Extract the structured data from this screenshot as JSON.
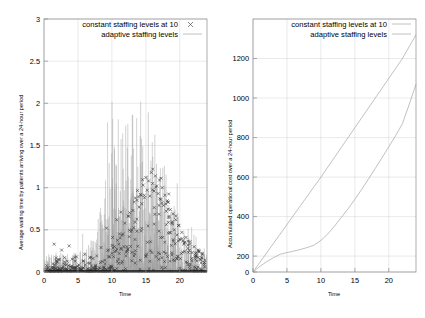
{
  "figure": {
    "panels": [
      "left",
      "right"
    ],
    "background": "#ffffff",
    "line_color": "#8d8d8d",
    "point_color": "#3a3a3a",
    "grid_color": "#c9c9c9"
  },
  "chart_data": [
    {
      "id": "waiting-time-chart",
      "type": "scatter",
      "title": "",
      "xlabel": "Time",
      "ylabel": "Average waiting time by patients arriving over a 24-hour period",
      "xlim": [
        0,
        24
      ],
      "ylim": [
        0,
        3
      ],
      "xticks": [
        0,
        5,
        10,
        15,
        20
      ],
      "yticks": [
        0,
        0.5,
        1,
        1.5,
        2,
        2.5,
        3
      ],
      "grid": true,
      "legend_position": "top-center",
      "series": [
        {
          "name": "constant staffing levels at 10",
          "style": "points",
          "marker": "cross",
          "x": [
            0.4,
            0.7,
            1.1,
            1.5,
            1.9,
            2.2,
            2.6,
            3.0,
            3.3,
            3.7,
            4.1,
            4.4,
            4.8,
            5.2,
            5.6,
            6.0,
            6.4,
            6.8,
            7.2,
            7.6,
            8.0,
            8.4,
            8.8,
            9.2,
            9.5,
            9.8,
            10.1,
            10.4,
            10.7,
            11.0,
            11.3,
            11.6,
            11.9,
            12.2,
            12.5,
            12.8,
            13.1,
            13.4,
            13.7,
            14.0,
            14.2,
            14.4,
            14.6,
            14.8,
            15.0,
            15.2,
            15.4,
            15.6,
            15.8,
            16.0,
            16.2,
            16.4,
            16.6,
            16.8,
            17.0,
            17.2,
            17.4,
            17.6,
            17.8,
            18.0,
            18.2,
            18.4,
            18.6,
            18.8,
            19.0,
            19.2,
            19.4,
            19.6,
            19.8,
            20.0,
            20.3,
            20.6,
            20.9,
            21.2,
            21.5,
            21.8,
            22.1,
            22.4,
            22.7,
            23.0,
            23.3,
            23.6
          ],
          "y": [
            0.03,
            0.02,
            0.05,
            0.33,
            0.12,
            0.02,
            0.26,
            0.09,
            0.04,
            0.31,
            0.07,
            0.02,
            0.18,
            0.05,
            0.03,
            0.21,
            0.04,
            0.02,
            0.16,
            0.08,
            0.03,
            0.29,
            0.06,
            0.52,
            0.18,
            0.07,
            0.41,
            0.24,
            0.62,
            0.33,
            0.71,
            0.45,
            0.58,
            0.3,
            0.66,
            0.48,
            0.73,
            0.59,
            0.85,
            0.77,
            0.92,
            0.81,
            1.03,
            0.88,
            1.12,
            0.97,
            1.08,
            0.9,
            1.18,
            1.05,
            0.96,
            1.14,
            1.02,
            0.93,
            1.09,
            0.86,
            1.0,
            0.79,
            0.91,
            0.72,
            0.83,
            0.66,
            0.74,
            0.58,
            0.69,
            0.5,
            0.62,
            0.44,
            0.55,
            0.38,
            0.47,
            0.33,
            0.41,
            0.28,
            0.36,
            0.23,
            0.3,
            0.19,
            0.26,
            0.15,
            0.22,
            0.11
          ]
        },
        {
          "name": "adaptive staffing levels",
          "style": "lines",
          "marker": "line",
          "description": "dense high-frequency spikes from baseline 0, peaks rising toward 2 near midday"
        }
      ]
    },
    {
      "id": "operational-cost-chart",
      "type": "line",
      "title": "",
      "xlabel": "Time",
      "ylabel": "Accumulated operational cost over a 24-hour period",
      "xlim": [
        0,
        24
      ],
      "ylim": [
        0,
        1280
      ],
      "xticks": [
        0,
        5,
        10,
        15,
        20
      ],
      "yticks": [
        0,
        200,
        400,
        600,
        800,
        1000,
        1200
      ],
      "grid": true,
      "legend_position": "top-center",
      "x": [
        0,
        1,
        2,
        3,
        4,
        5,
        6,
        7,
        8,
        9,
        10,
        11,
        12,
        13,
        14,
        15,
        16,
        17,
        18,
        19,
        20,
        21,
        22,
        23,
        24
      ],
      "series": [
        {
          "name": "constant staffing levels at 10",
          "style": "lines",
          "values": [
            0,
            48,
            96,
            144,
            192,
            240,
            288,
            336,
            384,
            432,
            480,
            530,
            580,
            630,
            680,
            730,
            780,
            830,
            880,
            930,
            980,
            1030,
            1080,
            1140,
            1200
          ]
        },
        {
          "name": "adaptive staffing levels",
          "style": "lines",
          "values": [
            0,
            28,
            52,
            72,
            90,
            98,
            106,
            114,
            124,
            136,
            160,
            192,
            232,
            276,
            320,
            368,
            418,
            470,
            524,
            578,
            634,
            690,
            750,
            848,
            950
          ]
        }
      ]
    }
  ],
  "left_panel": {
    "legend": [
      {
        "label": "constant staffing levels at 10",
        "marker": "cross"
      },
      {
        "label": "adaptive staffing levels",
        "marker": "line"
      }
    ],
    "xlabel": "Time",
    "ylabel": "Average waiting time by patients arriving over a 24-hour period",
    "xticks": [
      "0",
      "5",
      "10",
      "15",
      "20"
    ],
    "yticks": [
      "0",
      "0.5",
      "1",
      "1.5",
      "2",
      "2.5",
      "3"
    ]
  },
  "right_panel": {
    "legend": [
      {
        "label": "constant staffing levels at 10",
        "marker": "line"
      },
      {
        "label": "adaptive staffing levels",
        "marker": "line"
      }
    ],
    "xlabel": "Time",
    "ylabel": "Accumulated operational cost over a 24-hour period",
    "xticks": [
      "0",
      "5",
      "10",
      "15",
      "20"
    ],
    "yticks": [
      "0",
      "200",
      "400",
      "600",
      "800",
      "1000",
      "1200"
    ]
  }
}
